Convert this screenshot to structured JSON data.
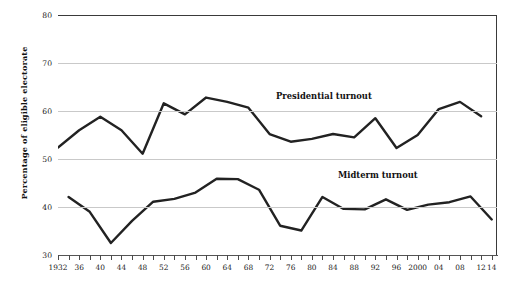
{
  "chart_data": {
    "type": "line",
    "title": "",
    "xlabel": "",
    "ylabel": "Percentage of eligible electorate",
    "ylim": [
      30,
      80
    ],
    "yticks": [
      30,
      40,
      50,
      60,
      70,
      80
    ],
    "grid": true,
    "legend_position": "inline-annotations",
    "xtick_labels": [
      "1932",
      "36",
      "40",
      "44",
      "48",
      "52",
      "56",
      "60",
      "64",
      "68",
      "72",
      "76",
      "80",
      "84",
      "88",
      "92",
      "96",
      "2000",
      "04",
      "08",
      "12",
      "14"
    ],
    "xtick_years": [
      1932,
      1936,
      1940,
      1944,
      1948,
      1952,
      1956,
      1960,
      1964,
      1968,
      1972,
      1976,
      1980,
      1984,
      1988,
      1992,
      1996,
      2000,
      2004,
      2008,
      2012,
      2014
    ],
    "minor_tick_interval_years": 2,
    "x_range": [
      1932,
      2015
    ],
    "series": [
      {
        "name": "Presidential turnout",
        "color": "#222222",
        "x": [
          1932,
          1936,
          1940,
          1944,
          1948,
          1952,
          1956,
          1960,
          1964,
          1968,
          1972,
          1976,
          1980,
          1984,
          1988,
          1992,
          1996,
          2000,
          2004,
          2008,
          2012
        ],
        "values": [
          52.4,
          56.0,
          58.8,
          56.0,
          51.1,
          61.6,
          59.3,
          62.8,
          61.9,
          60.7,
          55.2,
          53.6,
          54.2,
          55.2,
          54.5,
          58.5,
          52.3,
          55.0,
          60.4,
          61.9,
          58.9
        ]
      },
      {
        "name": "Midterm turnout",
        "color": "#222222",
        "x": [
          1934,
          1938,
          1942,
          1946,
          1950,
          1954,
          1958,
          1962,
          1966,
          1970,
          1974,
          1978,
          1982,
          1986,
          1990,
          1994,
          1998,
          2002,
          2006,
          2010,
          2014
        ],
        "values": [
          42.1,
          39.0,
          32.5,
          37.1,
          41.1,
          41.7,
          43.0,
          45.9,
          45.8,
          43.6,
          36.1,
          35.1,
          42.1,
          39.6,
          39.5,
          41.6,
          39.4,
          40.5,
          41.0,
          42.2,
          37.4
        ]
      }
    ],
    "annotations": [
      {
        "text": "Presidential turnout",
        "x": 1988,
        "y": 65
      },
      {
        "text": "Midterm turnout",
        "x": 1997,
        "y": 49
      }
    ]
  }
}
